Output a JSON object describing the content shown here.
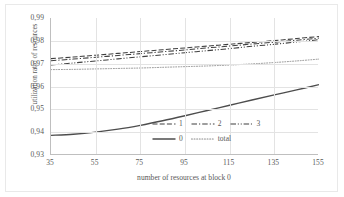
{
  "chart_data": {
    "type": "line",
    "title": "",
    "xlabel": "number of resources at block 0",
    "ylabel": "utilization ratio of resources",
    "xlim": [
      35,
      155
    ],
    "ylim": [
      0.93,
      0.99
    ],
    "xticks": [
      "35",
      "55",
      "75",
      "95",
      "115",
      "135",
      "155"
    ],
    "yticks": [
      "0,99",
      "0,98",
      "0,97",
      "0,96",
      "0,95",
      "0,94",
      "0,93"
    ],
    "grid": true,
    "legend_position": "inside-lower-right",
    "decimal_separator": ",",
    "x": [
      35,
      45,
      55,
      65,
      75,
      85,
      95,
      105,
      115,
      125,
      135,
      145,
      155
    ],
    "series": [
      {
        "name": "1",
        "style": "dashed",
        "color": "#3f3f3f",
        "values": [
          0.9722,
          0.9729,
          0.9737,
          0.9745,
          0.9753,
          0.9761,
          0.9769,
          0.9777,
          0.9785,
          0.9793,
          0.9801,
          0.981,
          0.9819
        ]
      },
      {
        "name": "2",
        "style": "dash-dot",
        "color": "#3f3f3f",
        "values": [
          0.9713,
          0.972,
          0.9728,
          0.9736,
          0.9744,
          0.9752,
          0.976,
          0.9769,
          0.9777,
          0.9786,
          0.9794,
          0.9803,
          0.9812
        ]
      },
      {
        "name": "3",
        "style": "dash-dot-dot",
        "color": "#3f3f3f",
        "values": [
          0.9694,
          0.9703,
          0.9712,
          0.9721,
          0.973,
          0.9739,
          0.9748,
          0.9757,
          0.9766,
          0.9776,
          0.9785,
          0.9795,
          0.9805
        ]
      },
      {
        "name": "0",
        "style": "solid",
        "color": "#4d4d4d",
        "values": [
          0.9386,
          0.9391,
          0.94,
          0.9413,
          0.943,
          0.945,
          0.9472,
          0.9495,
          0.9518,
          0.9541,
          0.9563,
          0.9585,
          0.9608
        ]
      },
      {
        "name": "total",
        "style": "dotted",
        "color": "#8a8a8a",
        "values": [
          0.9674,
          0.9675,
          0.9677,
          0.9679,
          0.9681,
          0.9684,
          0.9687,
          0.969,
          0.9694,
          0.9699,
          0.9705,
          0.9712,
          0.972
        ]
      }
    ],
    "legend": [
      {
        "label": "1",
        "style": "dashed"
      },
      {
        "label": "2",
        "style": "dash-dot"
      },
      {
        "label": "3",
        "style": "dash-dot-dot"
      },
      {
        "label": "0",
        "style": "solid"
      },
      {
        "label": "total",
        "style": "dotted"
      }
    ]
  }
}
